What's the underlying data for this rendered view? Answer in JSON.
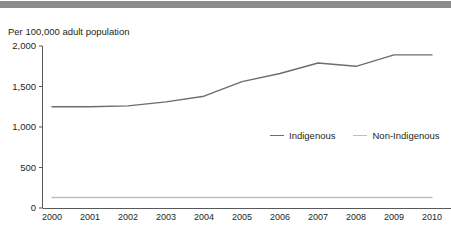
{
  "header": {
    "bar_color": "#8c8c8c"
  },
  "chart_data": {
    "type": "line",
    "title": "Per 100,000 adult population",
    "xlabel": "",
    "ylabel": "",
    "ylim": [
      0,
      2000
    ],
    "ytick_values": [
      0,
      500,
      1000,
      1500,
      2000
    ],
    "ytick_labels": [
      "0",
      "500",
      "1,000",
      "1,500",
      "2,000"
    ],
    "categories": [
      "2000",
      "2001",
      "2002",
      "2003",
      "2004",
      "2005",
      "2006",
      "2007",
      "2008",
      "2009",
      "2010"
    ],
    "x": [
      2000,
      2001,
      2002,
      2003,
      2004,
      2005,
      2006,
      2007,
      2008,
      2009,
      2010
    ],
    "grid": false,
    "legend_position": "center-right",
    "series": [
      {
        "name": "Indigenous",
        "color": "#6d6d6d",
        "values": [
          1250,
          1250,
          1260,
          1310,
          1380,
          1560,
          1660,
          1790,
          1750,
          1890,
          1890
        ]
      },
      {
        "name": "Non-Indigenous",
        "color": "#bfbfbf",
        "values": [
          130,
          130,
          130,
          130,
          130,
          130,
          130,
          130,
          130,
          130,
          130
        ]
      }
    ]
  }
}
